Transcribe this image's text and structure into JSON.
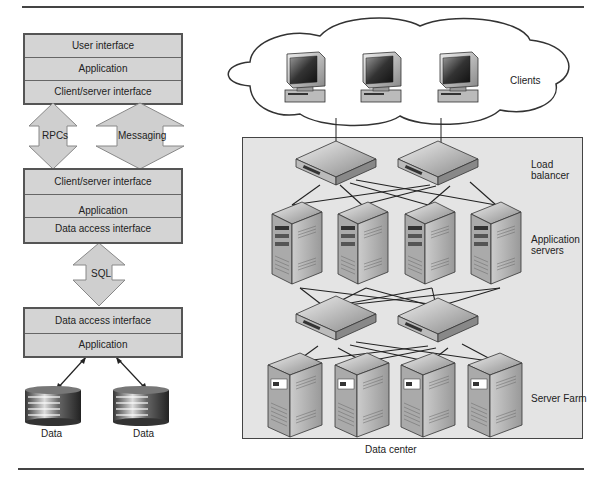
{
  "left_diagram": {
    "top_stack": [
      "User interface",
      "Application",
      "Client/server interface"
    ],
    "arrows_top": [
      {
        "label": "RPCs"
      },
      {
        "label": "Messaging"
      }
    ],
    "middle_stack": [
      "Client/server interface",
      "Application",
      "Data access interface"
    ],
    "arrow_mid": {
      "label": "SQL"
    },
    "bottom_stack": [
      "Data access interface",
      "Application"
    ],
    "databases": [
      {
        "label": "Data"
      },
      {
        "label": "Data"
      }
    ]
  },
  "right_diagram": {
    "clients_label": "Clients",
    "load_balancer_label": "Load\nbalancer",
    "load_balancer_lines": [
      "Load",
      "balancer"
    ],
    "app_servers_lines": [
      "Application",
      "servers"
    ],
    "server_farm_label": "Server Farm",
    "data_center_label": "Data center"
  },
  "colors": {
    "layer_fill": "#d4d4d4",
    "datacenter_fill": "#e4e4e4",
    "border": "#555555"
  }
}
